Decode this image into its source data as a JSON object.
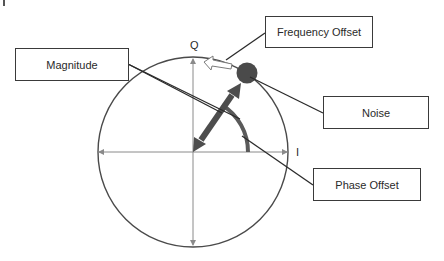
{
  "diagram": {
    "title": "",
    "axes": {
      "vertical_label": "Q",
      "horizontal_label": "I"
    },
    "callouts": [
      {
        "id": "magnitude",
        "label": "Magnitude"
      },
      {
        "id": "frequency-offset",
        "label": "Frequency Offset"
      },
      {
        "id": "noise",
        "label": "Noise"
      },
      {
        "id": "phase-offset",
        "label": "Phase Offset"
      }
    ],
    "colors": {
      "circle": "#4a4a4a",
      "axes": "#8a8a8a",
      "vector": "#4d4d4d",
      "noise_dot": "#4a4a4a",
      "phase_arc": "#5a5a5a",
      "leader_lines": "#2a2a2a",
      "box_border": "#3a3a3a"
    }
  }
}
